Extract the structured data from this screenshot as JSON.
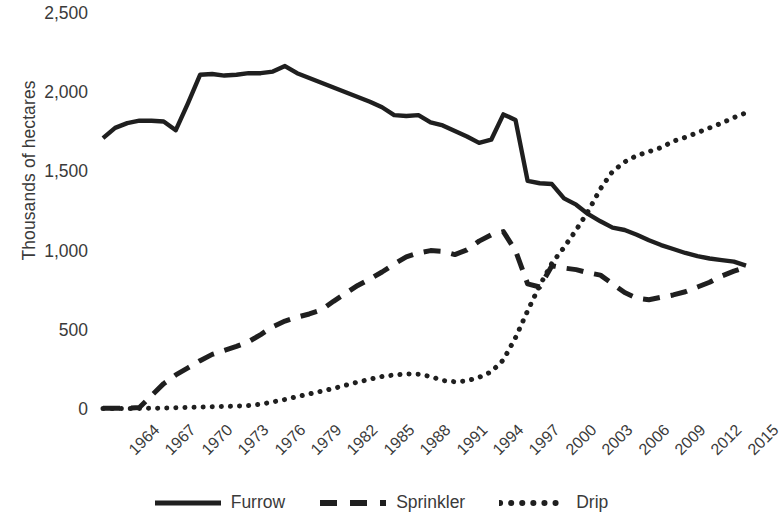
{
  "chart_data": {
    "type": "line",
    "title": "",
    "xlabel": "",
    "ylabel": "Thousands of hectares",
    "ylim": [
      0,
      2500
    ],
    "ytick_values": [
      2500,
      2000,
      1500,
      1000,
      500,
      0
    ],
    "ytick_labels": [
      "2,500",
      "2,000",
      "1,500",
      "1,000",
      "500",
      "0"
    ],
    "xlim": [
      1964,
      2017
    ],
    "xtick_labels": [
      "1964",
      "1967",
      "1970",
      "1973",
      "1976",
      "1979",
      "1982",
      "1985",
      "1988",
      "1991",
      "1994",
      "1997",
      "2000",
      "2003",
      "2006",
      "2009",
      "2012",
      "2015"
    ],
    "xtick_values": [
      1964,
      1967,
      1970,
      1973,
      1976,
      1979,
      1982,
      1985,
      1988,
      1991,
      1994,
      1997,
      2000,
      2003,
      2006,
      2009,
      2012,
      2015
    ],
    "grid": false,
    "legend_position": "bottom",
    "x": [
      1964,
      1965,
      1966,
      1967,
      1968,
      1969,
      1970,
      1971,
      1972,
      1973,
      1974,
      1975,
      1976,
      1977,
      1978,
      1979,
      1980,
      1981,
      1982,
      1983,
      1984,
      1985,
      1986,
      1987,
      1988,
      1989,
      1990,
      1991,
      1992,
      1993,
      1994,
      1995,
      1996,
      1997,
      1998,
      1999,
      2000,
      2001,
      2002,
      2003,
      2004,
      2005,
      2006,
      2007,
      2008,
      2009,
      2010,
      2011,
      2012,
      2013,
      2014,
      2015,
      2016,
      2017
    ],
    "series": [
      {
        "name": "Furrow",
        "style": "solid",
        "color": "#1f1f1f",
        "values": [
          1710,
          1775,
          1805,
          1820,
          1820,
          1815,
          1760,
          1930,
          2110,
          2115,
          2105,
          2110,
          2120,
          2120,
          2130,
          2165,
          2120,
          2090,
          2060,
          2030,
          2000,
          1970,
          1940,
          1905,
          1855,
          1850,
          1855,
          1810,
          1790,
          1755,
          1720,
          1680,
          1700,
          1860,
          1825,
          1440,
          1425,
          1420,
          1330,
          1290,
          1230,
          1185,
          1145,
          1130,
          1100,
          1065,
          1035,
          1010,
          985,
          965,
          950,
          940,
          930,
          905
        ]
      },
      {
        "name": "Sprinkler",
        "style": "dashed",
        "color": "#1f1f1f",
        "values": [
          5,
          5,
          5,
          10,
          85,
          160,
          215,
          260,
          305,
          345,
          370,
          395,
          425,
          470,
          520,
          555,
          580,
          600,
          625,
          680,
          730,
          780,
          820,
          865,
          915,
          960,
          985,
          1000,
          995,
          975,
          1005,
          1060,
          1100,
          1120,
          1000,
          790,
          770,
          905,
          890,
          880,
          860,
          845,
          790,
          735,
          700,
          690,
          705,
          720,
          740,
          770,
          800,
          840,
          870,
          895
        ]
      },
      {
        "name": "Drip",
        "style": "dotted",
        "color": "#1f1f1f",
        "values": [
          3,
          3,
          3,
          3,
          5,
          6,
          8,
          10,
          12,
          14,
          16,
          18,
          22,
          30,
          45,
          60,
          78,
          95,
          112,
          130,
          150,
          170,
          188,
          205,
          215,
          222,
          220,
          205,
          180,
          172,
          178,
          200,
          235,
          310,
          450,
          620,
          780,
          920,
          1020,
          1130,
          1250,
          1390,
          1500,
          1560,
          1600,
          1625,
          1650,
          1690,
          1715,
          1745,
          1775,
          1805,
          1840,
          1870
        ]
      }
    ]
  },
  "legend": {
    "items": [
      {
        "label": "Furrow",
        "style": "solid"
      },
      {
        "label": "Sprinkler",
        "style": "dashed"
      },
      {
        "label": "Drip",
        "style": "dotted"
      }
    ]
  }
}
